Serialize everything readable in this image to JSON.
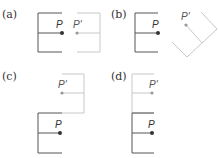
{
  "figure": {
    "panels": [
      {
        "label": "(a)",
        "point": "P",
        "image_point": "P'",
        "transform": "horizontal reflection"
      },
      {
        "label": "(b)",
        "point": "P",
        "image_point": "P'",
        "transform": "rotation"
      },
      {
        "label": "(c)",
        "point": "P",
        "image_point": "P'",
        "transform": "glide / rotated placement above"
      },
      {
        "label": "(d)",
        "point": "P",
        "image_point": "P'",
        "transform": "translation up"
      }
    ],
    "colors": {
      "original": "#555555",
      "image": "#c8c8c8",
      "point_original": "#333333",
      "point_image": "#999999"
    }
  }
}
